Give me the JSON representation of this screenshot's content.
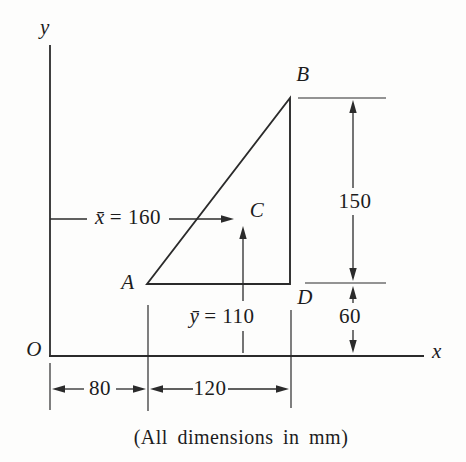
{
  "figure": {
    "caption": "(All dimensions in mm)",
    "axes": {
      "x_label": "x",
      "y_label": "y",
      "origin_label": "O"
    },
    "points": {
      "A": "A",
      "B": "B",
      "C": "C",
      "D": "D"
    },
    "centroid": {
      "x_symbol": "x̄",
      "x_eq": "= 160",
      "y_symbol": "ȳ",
      "y_eq": "= 110",
      "x_value_mm": 160,
      "y_value_mm": 110
    },
    "dimensions": {
      "right_height_mm": "150",
      "base_to_axis_mm": "60",
      "origin_to_A_mm": "80",
      "base_width_mm": "120"
    },
    "geometry_mm": {
      "A": [
        80,
        60
      ],
      "B": [
        200,
        210
      ],
      "D": [
        200,
        60
      ],
      "right_angle_at": "D"
    },
    "colors": {
      "line": "#2b2b2b",
      "text": "#1c1c1c",
      "background": "#fdfdfc"
    }
  }
}
